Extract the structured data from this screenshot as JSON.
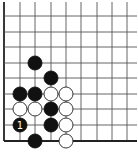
{
  "diagram": {
    "type": "go-board-corner",
    "corner": "lower-left",
    "grid": {
      "x": [
        4,
        20,
        35,
        51,
        66,
        81,
        97,
        112,
        127
      ],
      "y": [
        16,
        32,
        47,
        63,
        78,
        94,
        109,
        125,
        141
      ],
      "line_color": "#555555",
      "edge_color": "#222222"
    },
    "stone_radius": 7,
    "colors": {
      "black": "#111111",
      "white": "#ffffff",
      "white_stroke": "#222222",
      "label_on_black": "#ffffff"
    },
    "stones": [
      {
        "color": "black",
        "col": 2,
        "row": 3,
        "label": ""
      },
      {
        "color": "black",
        "col": 3,
        "row": 4,
        "label": ""
      },
      {
        "color": "black",
        "col": 1,
        "row": 5,
        "label": ""
      },
      {
        "color": "black",
        "col": 2,
        "row": 5,
        "label": ""
      },
      {
        "color": "white",
        "col": 3,
        "row": 5,
        "label": ""
      },
      {
        "color": "white",
        "col": 4,
        "row": 5,
        "label": ""
      },
      {
        "color": "white",
        "col": 1,
        "row": 6,
        "label": ""
      },
      {
        "color": "white",
        "col": 2,
        "row": 6,
        "label": ""
      },
      {
        "color": "black",
        "col": 3,
        "row": 6,
        "label": ""
      },
      {
        "color": "white",
        "col": 4,
        "row": 6,
        "label": ""
      },
      {
        "color": "black",
        "col": 1,
        "row": 7,
        "label": "1"
      },
      {
        "color": "black",
        "col": 3,
        "row": 7,
        "label": ""
      },
      {
        "color": "white",
        "col": 4,
        "row": 7,
        "label": ""
      },
      {
        "color": "black",
        "col": 2,
        "row": 8,
        "label": ""
      },
      {
        "color": "white",
        "col": 4,
        "row": 8,
        "label": ""
      }
    ]
  }
}
